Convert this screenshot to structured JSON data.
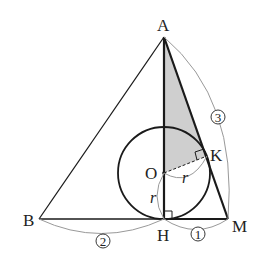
{
  "figure": {
    "points": {
      "A": {
        "label": "A",
        "x": 164,
        "y": 37
      },
      "B": {
        "label": "B",
        "x": 39,
        "y": 219
      },
      "H": {
        "label": "H",
        "x": 164,
        "y": 219
      },
      "M": {
        "label": "M",
        "x": 228,
        "y": 219
      },
      "O": {
        "label": "O",
        "x": 164,
        "y": 173
      },
      "K": {
        "label": "K",
        "x": 207,
        "y": 156
      }
    },
    "circle": {
      "center": "O",
      "radius": 46
    },
    "radius_labels": [
      "r",
      "r"
    ],
    "length_labels": {
      "BH": "2",
      "HM": "1",
      "AM": "3"
    },
    "shaded_region": [
      "A",
      "O",
      "K"
    ],
    "colors": {
      "line": "#1a1a1a",
      "arc": "#999999",
      "shade": "#cfcfcf"
    }
  }
}
